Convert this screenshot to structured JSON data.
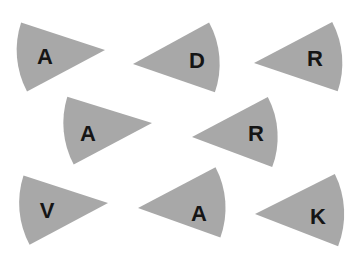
{
  "canvas": {
    "width": 362,
    "height": 259,
    "background": "#ffffff"
  },
  "style": {
    "wedge_fill": "#a8a8a8",
    "letter_color": "#151515"
  },
  "wedges": [
    {
      "letter": "A",
      "tip": [
        105,
        50
      ],
      "arc_start": [
        20,
        22
      ],
      "arc_end": [
        28,
        91
      ],
      "label_pos": [
        45,
        56
      ]
    },
    {
      "letter": "D",
      "tip": [
        133,
        64
      ],
      "arc_start": [
        210,
        22
      ],
      "arc_end": [
        214,
        92
      ],
      "label_pos": [
        197,
        60
      ]
    },
    {
      "letter": "R",
      "tip": [
        254,
        63
      ],
      "arc_start": [
        330,
        23
      ],
      "arc_end": [
        340,
        92
      ],
      "label_pos": [
        315,
        58
      ]
    },
    {
      "letter": "A",
      "tip": [
        152,
        123
      ],
      "arc_start": [
        68,
        97
      ],
      "arc_end": [
        73,
        165
      ],
      "label_pos": [
        88,
        133
      ]
    },
    {
      "letter": "R",
      "tip": [
        192,
        137
      ],
      "arc_start": [
        268,
        97
      ],
      "arc_end": [
        272,
        167
      ],
      "label_pos": [
        256,
        133
      ]
    },
    {
      "letter": "V",
      "tip": [
        108,
        203
      ],
      "arc_start": [
        22,
        175
      ],
      "arc_end": [
        31,
        244
      ],
      "label_pos": [
        47,
        210
      ]
    },
    {
      "letter": "A",
      "tip": [
        138,
        208
      ],
      "arc_start": [
        214,
        168
      ],
      "arc_end": [
        222,
        238
      ],
      "label_pos": [
        199,
        213
      ]
    },
    {
      "letter": "K",
      "tip": [
        255,
        214
      ],
      "arc_start": [
        333,
        175
      ],
      "arc_end": [
        340,
        247
      ],
      "label_pos": [
        318,
        216
      ]
    }
  ]
}
